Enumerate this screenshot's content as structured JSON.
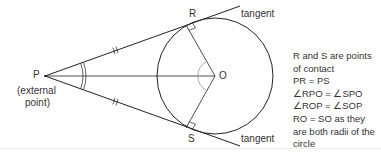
{
  "diagram": {
    "type": "geometry-tangents-from-external-point",
    "points": {
      "P": {
        "label": "P",
        "x": 45,
        "y": 76
      },
      "O": {
        "label": "O",
        "x": 215,
        "y": 76
      },
      "R": {
        "label": "R",
        "x": 186,
        "y": 25
      },
      "S": {
        "label": "S",
        "x": 186,
        "y": 128
      }
    },
    "circle": {
      "cx": 215,
      "cy": 76,
      "r": 58
    },
    "labels": {
      "P": "P",
      "O": "O",
      "R": "R",
      "S": "S",
      "external_point_line1": "(external",
      "external_point_line2": "point)",
      "tangent_top": "tangent",
      "tangent_bottom": "tangent"
    },
    "notes": [
      "R and S are points",
      "of contact",
      "PR = PS",
      "∠RPO = ∠SPO",
      "∠ROP = ∠SOP",
      "RO = SO as they",
      "are both radii of the",
      "circle"
    ],
    "colors": {
      "line": "#222222",
      "angle_arc": "#888888",
      "text": "#333333"
    }
  }
}
